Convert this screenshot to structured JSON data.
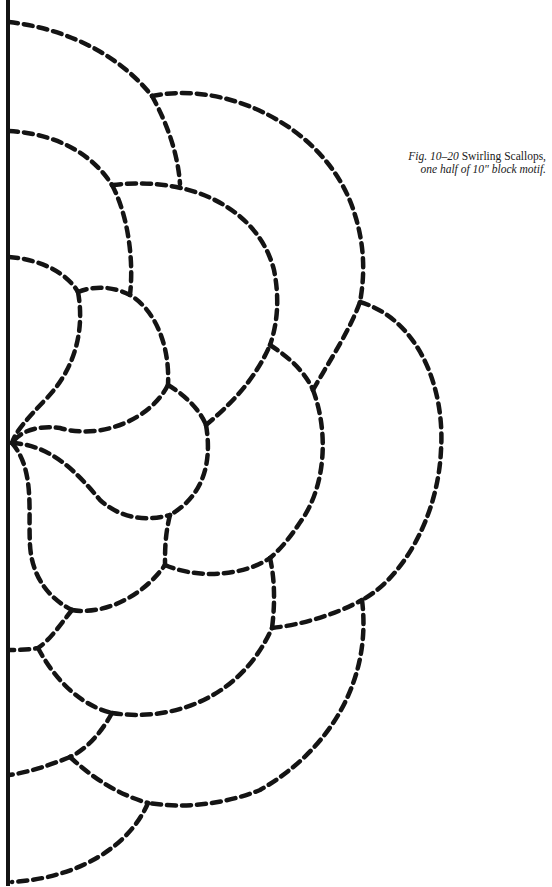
{
  "caption": {
    "fig_label": "Fig. 10–20",
    "title": "Swirling Scallops,",
    "subtitle": "one half of 10\" block motif."
  },
  "style": {
    "ink_color": "#141414",
    "background": "#ffffff",
    "dash_pattern": "9 6",
    "dash_width": 4.5,
    "center_line_width": 4
  },
  "center_line": {
    "x": 8,
    "y1": 0,
    "y2": 886
  },
  "quilting_lines": [
    {
      "name": "top-outer-arc",
      "d": "M 9 22 C 60 28 115 50 152 96"
    },
    {
      "name": "top-connector",
      "d": "M 152 96 C 168 125 178 155 180 184"
    },
    {
      "name": "outer-scallop-top",
      "d": "M 152 96 C 230 80 330 130 355 215 C 366 250 364 280 360 302"
    },
    {
      "name": "second-arc",
      "d": "M 9 131 C 50 133 90 150 112 185"
    },
    {
      "name": "second-connector",
      "d": "M 112 185 C 128 215 134 260 130 295"
    },
    {
      "name": "middle-scallop",
      "d": "M 112 185 C 200 175 260 215 274 270 C 280 300 277 325 270 345"
    },
    {
      "name": "third-arc",
      "d": "M 9 257 C 45 260 68 275 78 292"
    },
    {
      "name": "inner-petal-top",
      "d": "M 78 292 C 95 285 115 287 130 295 C 155 310 170 345 168 385"
    },
    {
      "name": "inner-petal-left",
      "d": "M 78 292 C 85 330 75 370 45 400 C 28 418 15 432 12 443"
    },
    {
      "name": "inner-petal-bottom",
      "d": "M 168 385 C 150 420 100 440 60 428 C 35 425 20 432 12 443"
    },
    {
      "name": "petal-link-1",
      "d": "M 168 385 C 185 395 200 410 206 425"
    },
    {
      "name": "petal-link-2",
      "d": "M 206 425 C 230 405 255 380 270 345"
    },
    {
      "name": "petal-link-3",
      "d": "M 270 345 C 290 358 305 372 313 390"
    },
    {
      "name": "right-petal-up",
      "d": "M 313 390 C 330 360 350 330 360 302"
    },
    {
      "name": "big-right-scallop",
      "d": "M 360 302 C 420 320 445 390 441 450 C 438 520 400 580 362 600"
    },
    {
      "name": "right-petal-down",
      "d": "M 313 390 C 328 430 326 480 305 515 C 292 535 282 548 270 558"
    },
    {
      "name": "center-petal-right",
      "d": "M 206 425 C 212 460 205 495 170 515"
    },
    {
      "name": "center-lower-curve",
      "d": "M 12 443 C 50 445 75 470 100 500 C 120 518 145 522 170 515"
    },
    {
      "name": "center-to-link",
      "d": "M 170 515 C 165 535 165 550 165 565"
    },
    {
      "name": "center-down",
      "d": "M 12 443 C 35 470 28 510 30 545 C 32 580 52 600 72 610"
    },
    {
      "name": "lower-scallop-1",
      "d": "M 72 610 C 100 615 140 600 165 565"
    },
    {
      "name": "lower-link-1",
      "d": "M 165 565 C 200 580 245 575 270 558"
    },
    {
      "name": "lower-link-2",
      "d": "M 270 558 C 275 580 275 605 272 628"
    },
    {
      "name": "lower-link-3",
      "d": "M 272 628 C 300 625 335 615 362 600"
    },
    {
      "name": "lower-left-1",
      "d": "M 72 610 C 60 625 50 640 38 648 C 28 650 18 650 9 650"
    },
    {
      "name": "lower-scallop-2",
      "d": "M 38 648 C 55 680 80 705 112 713"
    },
    {
      "name": "lower-big-curve",
      "d": "M 112 713 C 170 722 240 700 272 628"
    },
    {
      "name": "lower-outer-scallop",
      "d": "M 362 600 C 372 680 330 750 260 790 C 220 806 180 808 148 803"
    },
    {
      "name": "lower-link-4",
      "d": "M 112 713 C 100 735 85 750 70 757"
    },
    {
      "name": "lower-left-2",
      "d": "M 70 757 C 50 765 30 772 9 775"
    },
    {
      "name": "lower-scallop-3",
      "d": "M 70 757 C 95 780 120 795 148 803"
    },
    {
      "name": "bottom-arc",
      "d": "M 148 803 C 130 845 80 878 12 882"
    }
  ]
}
